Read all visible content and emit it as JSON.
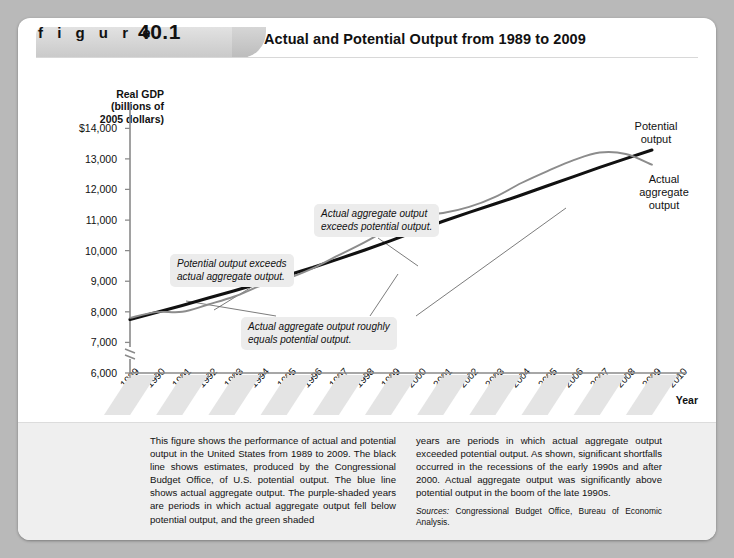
{
  "header": {
    "figure_word": "f i g u r e",
    "figure_number": "40.1",
    "title": "Actual and Potential Output from 1989 to 2009"
  },
  "series_labels": {
    "potential": "Potential\noutput",
    "potential_line1": "Potential",
    "potential_line2": "output",
    "actual_line1": "Actual",
    "actual_line2": "aggregate",
    "actual_line3": "output"
  },
  "callouts": [
    {
      "id": "potential-exceeds-actual",
      "line1": "Potential output exceeds",
      "line2": "actual aggregate output."
    },
    {
      "id": "actual-exceeds-potential",
      "line1": "Actual aggregate output",
      "line2": "exceeds potential output."
    },
    {
      "id": "roughly-equal",
      "line1": "Actual aggregate output roughly",
      "line2": "equals potential output."
    }
  ],
  "caption": {
    "left": "This figure shows the performance of actual and potential output in the United States from 1989 to 2009. The black line shows estimates, produced by the Congressional Budget Office, of U.S. potential output. The blue line shows actual aggregate output. The purple-shaded years are periods in which actual aggregate output fell below potential output, and the green shaded",
    "right": "years are periods in which actual aggregate output exceeded potential output. As shown, significant shortfalls occurred in the recessions of the early 1990s and after 2000. Actual aggregate output was significantly above potential output in the boom of the late 1990s.",
    "sources_label": "Sources:",
    "sources_text": " Congressional Budget Office, Bureau of Economic Analysis."
  },
  "colors": {
    "potential_line": "#111111",
    "actual_line": "#8c8c8c",
    "callout_background": "#ececec",
    "band_shade": "#e4e4e4",
    "card_background": "#ffffff",
    "caption_background": "#efefef"
  },
  "chart_data": {
    "type": "line",
    "title": "Actual and Potential Output from 1989 to 2009",
    "xlabel": "Year",
    "ylabel": "Real GDP (billions of 2005 dollars)",
    "xlim": [
      1989,
      2010
    ],
    "ylim": [
      6000,
      14500
    ],
    "yticks": [
      6000,
      7000,
      8000,
      9000,
      10000,
      11000,
      12000,
      13000,
      14000
    ],
    "ytick_labels": [
      "6,000",
      "7,000",
      "8,000",
      "9,000",
      "10,000",
      "11,000",
      "12,000",
      "13,000",
      "$14,000"
    ],
    "xticks": [
      1989,
      1990,
      1991,
      1992,
      1993,
      1994,
      1995,
      1996,
      1997,
      1998,
      1999,
      2000,
      2001,
      2002,
      2003,
      2004,
      2005,
      2006,
      2007,
      2008,
      2009,
      2010
    ],
    "xtick_labels": [
      "1989",
      "1990",
      "1991",
      "1992",
      "1993",
      "1994",
      "1995",
      "1996",
      "1997",
      "1998",
      "1999",
      "2000",
      "2001",
      "2002",
      "2003",
      "2004",
      "2005",
      "2006",
      "2007",
      "2008",
      "2009",
      "2010"
    ],
    "axis_break_below": 6000,
    "grid": false,
    "legend": "inline-labels",
    "x": [
      1989,
      1990,
      1991,
      1992,
      1993,
      1994,
      1995,
      1996,
      1997,
      1998,
      1999,
      2000,
      2001,
      2002,
      2003,
      2004,
      2005,
      2006,
      2007,
      2008,
      2009
    ],
    "series": [
      {
        "name": "Potential output",
        "color": "#111111",
        "values": [
          7750,
          7980,
          8210,
          8450,
          8690,
          8940,
          9190,
          9450,
          9730,
          10020,
          10330,
          10650,
          10960,
          11250,
          11530,
          11820,
          12120,
          12420,
          12720,
          13010,
          13290
        ]
      },
      {
        "name": "Actual aggregate output",
        "color": "#8c8c8c",
        "values": [
          7800,
          7990,
          8000,
          8240,
          8500,
          8850,
          9080,
          9420,
          9850,
          10280,
          10750,
          11160,
          11230,
          11430,
          11760,
          12210,
          12600,
          12960,
          13210,
          13160,
          12810
        ]
      }
    ],
    "annotations": [
      {
        "text": "Potential output exceeds actual aggregate output.",
        "points_to_year": 1992
      },
      {
        "text": "Actual aggregate output exceeds potential output.",
        "points_to_year": 1999
      },
      {
        "text": "Actual aggregate output roughly equals potential output.",
        "points_to_years": [
          1990,
          2002,
          2007
        ]
      }
    ]
  }
}
